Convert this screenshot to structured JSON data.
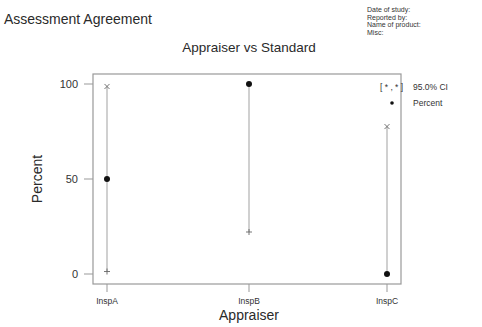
{
  "header": {
    "title": "Assessment Agreement",
    "meta": [
      "Date of study:",
      "Reported by:",
      "Name of product:",
      "Misc:"
    ]
  },
  "chart_data": {
    "type": "scatter",
    "title": "Appraiser vs Standard",
    "xlabel": "Appraiser",
    "ylabel": "Percent",
    "categories": [
      "InspA",
      "InspB",
      "InspC"
    ],
    "series": [
      {
        "name": "Percent",
        "values": [
          50,
          100,
          0
        ]
      },
      {
        "name": "95.0% CI lower",
        "values": [
          1.3,
          22.1,
          0
        ]
      },
      {
        "name": "95.0% CI upper",
        "values": [
          98.7,
          100,
          77.6
        ]
      }
    ],
    "yticks": [
      0,
      50,
      100
    ],
    "ylim": [
      -5,
      105
    ],
    "grid": false,
    "legend": {
      "position": "right",
      "entries": [
        {
          "symbol": "[ * , * ]",
          "label": "95.0% CI"
        },
        {
          "symbol": "•",
          "label": "Percent"
        }
      ]
    },
    "colors": {
      "frame": "#999999",
      "interval": "#aaaaaa",
      "point": "#111111"
    }
  }
}
